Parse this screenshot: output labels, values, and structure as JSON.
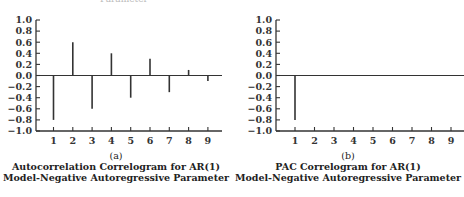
{
  "header_fragment": "Parameter",
  "chart_data": [
    {
      "type": "bar",
      "subtype": "correlogram-stem",
      "tag": "(a)",
      "title": "Autocorrelation Correlogram for AR(1)",
      "subtitle": "Model-Negative Autoregressive Parameter",
      "xlabel": "",
      "ylabel": "",
      "categories": [
        "1",
        "2",
        "3",
        "4",
        "5",
        "6",
        "7",
        "8",
        "9"
      ],
      "values": [
        -0.8,
        0.6,
        -0.6,
        0.4,
        -0.4,
        0.3,
        -0.3,
        0.1,
        -0.1
      ],
      "ylim": [
        -1.0,
        1.0
      ],
      "yticks": [
        "1.0",
        "0.8",
        "0.6",
        "0.4",
        "0.2",
        "0.0",
        "-0.2",
        "-0.4",
        "-0.6",
        "-0.8",
        "-1.0"
      ],
      "grid": false,
      "legend": null
    },
    {
      "type": "bar",
      "subtype": "correlogram-stem",
      "tag": "(b)",
      "title": "PAC Correlogram for AR(1)",
      "subtitle": "Model-Negative Autoregressive Parameter",
      "xlabel": "",
      "ylabel": "",
      "categories": [
        "1",
        "2",
        "3",
        "4",
        "5",
        "6",
        "7",
        "8",
        "9"
      ],
      "values": [
        -0.8,
        0,
        0,
        0,
        0,
        0,
        0,
        0,
        0
      ],
      "ylim": [
        -1.0,
        1.0
      ],
      "yticks": [
        "1.0",
        "0.8",
        "0.6",
        "0.4",
        "0.2",
        "0.0",
        "-0.2",
        "-0.4",
        "-0.6",
        "-0.8",
        "-1.0"
      ],
      "grid": false,
      "legend": null
    }
  ],
  "colors": {
    "stem": "#333333",
    "axis": "#333333",
    "text": "#222222"
  }
}
